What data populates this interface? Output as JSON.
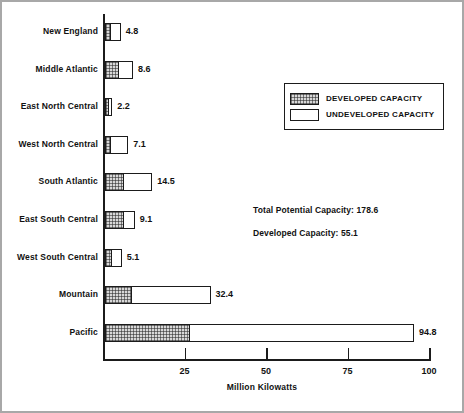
{
  "chart_data": {
    "type": "bar",
    "orientation": "horizontal",
    "stacked": true,
    "title": "",
    "xlabel": "Million Kilowatts",
    "ylabel": "",
    "xlim": [
      0,
      100
    ],
    "xticks": [
      25,
      50,
      75,
      100
    ],
    "xtick_labels": [
      "25",
      "50",
      "75",
      "100"
    ],
    "grid": false,
    "legend_position": "upper-right",
    "categories": [
      "New England",
      "Middle Atlantic",
      "East North Central",
      "West North Central",
      "South Atlantic",
      "East South Central",
      "West South Central",
      "Mountain",
      "Pacific"
    ],
    "series": [
      {
        "name": "DEVELOPED CAPACITY",
        "values": [
          1.5,
          4.0,
          0.9,
          1.6,
          5.6,
          5.6,
          1.8,
          8.1,
          25.8
        ]
      },
      {
        "name": "UNDEVELOPED CAPACITY",
        "values": [
          3.3,
          4.6,
          1.3,
          5.5,
          8.9,
          3.5,
          3.3,
          24.3,
          69.0
        ]
      }
    ],
    "totals": [
      4.8,
      8.6,
      2.2,
      7.1,
      14.5,
      9.1,
      5.1,
      32.4,
      94.8
    ],
    "total_labels": [
      "4.8",
      "8.6",
      "2.2",
      "7.1",
      "14.5",
      "9.1",
      "5.1",
      "32.4",
      "94.8"
    ],
    "annotations": [
      "Total Potential Capacity:  178.6",
      "Developed Capacity:  55.1"
    ],
    "colors": {
      "developed": "#d8d8d8",
      "undeveloped": "#ffffff",
      "outline": "#1b1b1b",
      "text": "#111111"
    }
  },
  "legend": {
    "items": [
      {
        "label": "DEVELOPED CAPACITY",
        "swatch": "hatched"
      },
      {
        "label": "UNDEVELOPED CAPACITY",
        "swatch": "plain"
      }
    ]
  },
  "annotations": {
    "total_potential": "Total Potential Capacity:  178.6",
    "developed": "Developed Capacity:  55.1"
  },
  "axis": {
    "x_title": "Million Kilowatts",
    "ticks": [
      "25",
      "50",
      "75",
      "100"
    ]
  }
}
